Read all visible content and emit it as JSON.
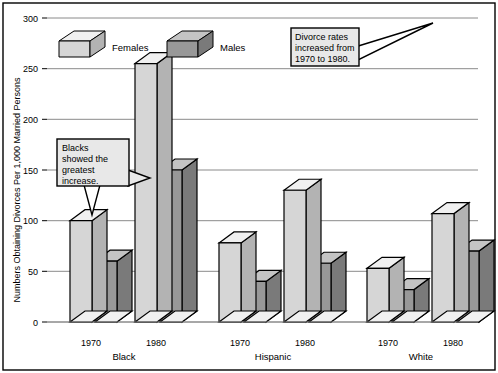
{
  "chart_data": {
    "type": "bar",
    "title": "",
    "subtitle": "",
    "xlabel": "",
    "ylabel": "Numbers Obtaining Divorces Per 1,000 Married Persons",
    "ylim": [
      0,
      300
    ],
    "yticks": [
      0,
      50,
      100,
      150,
      200,
      250,
      300
    ],
    "ytick_labels": [
      "0",
      "50",
      "100",
      "150",
      "200",
      "250",
      "300"
    ],
    "grid": true,
    "legend_position": "top-left",
    "categories": [
      "1970",
      "1980",
      "1970",
      "1980",
      "1970",
      "1980"
    ],
    "groups": [
      {
        "name": "Black",
        "spans": [
          0,
          1
        ]
      },
      {
        "name": "Hispanic",
        "spans": [
          2,
          3
        ]
      },
      {
        "name": "White",
        "spans": [
          4,
          5
        ]
      }
    ],
    "series": [
      {
        "name": "Females",
        "color": "#d6d6d6",
        "values": [
          100,
          255,
          78,
          130,
          53,
          107
        ]
      },
      {
        "name": "Males",
        "color": "#989898",
        "values": [
          60,
          150,
          40,
          58,
          32,
          70
        ]
      }
    ],
    "annotations": [
      {
        "id": "blacks-callout",
        "lines": [
          "Blacks",
          "showed the",
          "greatest",
          "increase."
        ]
      },
      {
        "id": "divorce-rates-callout",
        "lines": [
          "Divorce rates",
          "increased from",
          "1970 to 1980."
        ]
      }
    ]
  },
  "legend": {
    "items": [
      {
        "label": "Females",
        "swatch": "legend-swatch-females"
      },
      {
        "label": "Males",
        "swatch": "legend-swatch-males"
      }
    ]
  },
  "axis": {
    "y_title": "Numbers Obtaining Divorces Per 1,000 Married Persons",
    "y_tick_0": "0",
    "y_tick_50": "50",
    "y_tick_100": "100",
    "y_tick_150": "150",
    "y_tick_200": "200",
    "y_tick_250": "250",
    "y_tick_300": "300"
  },
  "x_labels": {
    "g0": "1970",
    "g1": "1980",
    "g2": "1970",
    "g3": "1980",
    "g4": "1970",
    "g5": "1980"
  },
  "group_labels": {
    "black": "Black",
    "hispanic": "Hispanic",
    "white": "White"
  },
  "callouts": {
    "blacks": {
      "line1": "Blacks",
      "line2": "showed the",
      "line3": "greatest",
      "line4": "increase."
    },
    "divorce": {
      "line1": "Divorce rates",
      "line2": "increased from",
      "line3": "1970 to 1980."
    }
  },
  "colors": {
    "females_front": "#d6d6d6",
    "females_top": "#f0f0f0",
    "females_side": "#b3b3b3",
    "males_front": "#989898",
    "males_top": "#c4c4c4",
    "males_side": "#7a7a7a",
    "grid": "#909090",
    "border": "#000000",
    "callout_fill": "#e8e8e8"
  }
}
